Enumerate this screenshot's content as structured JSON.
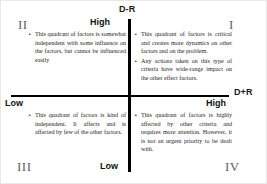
{
  "figure": {
    "axes": {
      "vertical_label": "D-R",
      "horizontal_label": "D+R",
      "vertical_top_marker": "High",
      "vertical_bottom_marker": "Low",
      "horizontal_left_marker": "Low",
      "horizontal_right_marker": "High",
      "line_color": "#000000"
    },
    "quadrants": [
      {
        "numeral": "I",
        "position": "top-right",
        "bullets": [
          "This quadrant of factors is critical and creates more dynamics on other factors and on the problem.",
          "Any actions taken on this type of criteria have wide-range impact on the other effect factors."
        ]
      },
      {
        "numeral": "II",
        "position": "top-left",
        "bullets": [
          "This quadrant of factors is somewhat independent with some influence on the factors, but cannot be influenced easily"
        ]
      },
      {
        "numeral": "III",
        "position": "bottom-left",
        "bullets": [
          "This quadrant of factors is kind of independent. It affects and is affected by few of the other factors."
        ]
      },
      {
        "numeral": "IV",
        "position": "bottom-right",
        "bullets": [
          "This quadrant of factors is highly affected by other criteria and requires more attention. However, it is not an urgent priority to be dealt with."
        ]
      }
    ],
    "bullet_glyph": "▪"
  }
}
